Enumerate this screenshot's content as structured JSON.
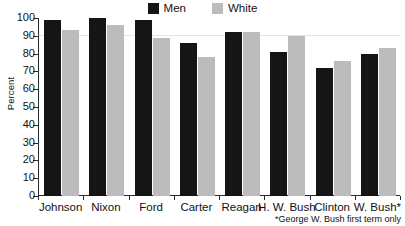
{
  "chart_data": {
    "type": "bar",
    "title": "",
    "subtitle": "",
    "xlabel": "",
    "ylabel": "Percent",
    "ylim": [
      0,
      100
    ],
    "yticks": [
      0,
      10,
      20,
      30,
      40,
      50,
      60,
      70,
      80,
      90,
      100
    ],
    "ytick_labels": [
      "0",
      "10",
      "20",
      "30",
      "40",
      "50",
      "60",
      "70",
      "80",
      "90",
      "100"
    ],
    "grid": false,
    "legend_position": "top-center",
    "categories": [
      "Johnson",
      "Nixon",
      "Ford",
      "Carter",
      "Reagan",
      "H. W. Bush",
      "Clinton",
      "W. Bush*"
    ],
    "series": [
      {
        "name": "Men",
        "color": "#151515",
        "values": [
          99,
          100,
          99,
          86,
          92,
          81,
          72,
          80
        ]
      },
      {
        "name": "White",
        "color": "#bcbcbc",
        "values": [
          93,
          96,
          89,
          78,
          92,
          90,
          76,
          83
        ]
      }
    ],
    "annotations": [
      "*George W. Bush first term only"
    ]
  },
  "legend": {
    "entries": [
      {
        "label": "Men",
        "color": "#151515",
        "swatch_name": "legend-swatch-men"
      },
      {
        "label": "White",
        "color": "#bcbcbc",
        "swatch_name": "legend-swatch-white"
      }
    ]
  },
  "axes": {
    "y_axis_title": "Percent"
  },
  "footnote": {
    "text": "*George W. Bush first term only"
  }
}
